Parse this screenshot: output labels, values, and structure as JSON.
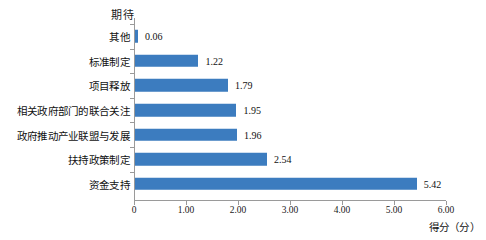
{
  "chart_data": {
    "type": "bar",
    "orientation": "horizontal",
    "title": "",
    "xlabel": "得分（分）",
    "ylabel": "期待",
    "categories": [
      "其他",
      "标准制定",
      "项目释放",
      "相关政府部门的联合关注",
      "政府推动产业联盟与发展",
      "扶持政策制定",
      "资金支持"
    ],
    "values": [
      0.06,
      1.22,
      1.79,
      1.95,
      1.96,
      2.54,
      5.42
    ],
    "value_labels": [
      "0.06",
      "1.22",
      "1.79",
      "1.95",
      "1.96",
      "2.54",
      "5.42"
    ],
    "xlim": [
      0,
      6
    ],
    "xticks": [
      0,
      1,
      2,
      3,
      4,
      5,
      6
    ],
    "xtick_labels": [
      "0",
      "1.00",
      "2.00",
      "3.00",
      "4.00",
      "5.00",
      "6.00"
    ],
    "grid": false,
    "legend": false,
    "bar_color": "#3c7cbf",
    "axis_color": "#9a9a9a",
    "background": "#ffffff"
  }
}
